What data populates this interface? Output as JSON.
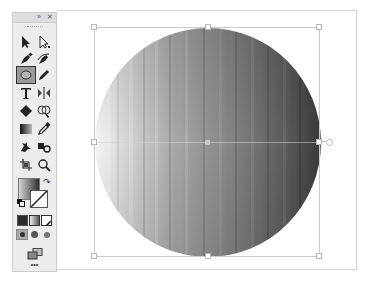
{
  "app": "Vector illustration editor",
  "toolbar": {
    "header": {
      "expand_glyph": "»",
      "close_glyph": "✕"
    },
    "tools": [
      {
        "name": "selection-tool",
        "icon": "arrow-solid"
      },
      {
        "name": "direct-selection-tool",
        "icon": "arrow-hollow"
      },
      {
        "name": "pen-tool",
        "icon": "pen"
      },
      {
        "name": "curvature-tool",
        "icon": "curvature-pen"
      },
      {
        "name": "ellipse-tool",
        "icon": "ellipse",
        "active": true
      },
      {
        "name": "pencil-tool",
        "icon": "pencil"
      },
      {
        "name": "type-tool",
        "icon": "T"
      },
      {
        "name": "reflect-tool",
        "icon": "reflect"
      },
      {
        "name": "eraser-tool",
        "icon": "eraser"
      },
      {
        "name": "shape-builder-tool",
        "icon": "shape-builder"
      },
      {
        "name": "gradient-tool",
        "icon": "gradient"
      },
      {
        "name": "eyedropper-tool",
        "icon": "eyedropper"
      },
      {
        "name": "puppet-warp-tool",
        "icon": "puppet-warp"
      },
      {
        "name": "symbol-sprayer-tool",
        "icon": "symbol-sprayer"
      },
      {
        "name": "artboard-tool",
        "icon": "artboard"
      },
      {
        "name": "zoom-tool",
        "icon": "magnifier"
      }
    ],
    "fill_stroke": {
      "fill": "gradient",
      "stroke": "none"
    },
    "color_modes": [
      "color",
      "gradient",
      "none"
    ],
    "draw_modes": [
      "draw-normal",
      "draw-behind",
      "draw-inside"
    ],
    "screen_mode_icon": "screen-mode",
    "more_label": "•••"
  },
  "canvas": {
    "object": {
      "type": "ellipse",
      "fill": "linear-gradient-grayscale",
      "gradient_stops": [
        "#f4f4f4",
        "#9a9a9a",
        "#6b6b6b",
        "#3e3e3e"
      ],
      "selected": true
    }
  }
}
